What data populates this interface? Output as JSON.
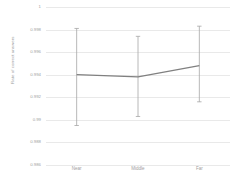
{
  "chart_data": {
    "type": "line",
    "title": "",
    "xlabel": "",
    "ylabel": "Rate of correct answers",
    "categories": [
      "Near",
      "Middle",
      "Far"
    ],
    "series": [
      {
        "name": "Rate of correct answers",
        "values": [
          0.994,
          0.9938,
          0.9948
        ],
        "error_low": [
          0.9895,
          0.9903,
          0.9916
        ],
        "error_high": [
          0.9981,
          0.9974,
          0.9983
        ]
      }
    ],
    "ylim": [
      0.986,
      1
    ],
    "yticks": [
      1,
      0.998,
      0.996,
      0.994,
      0.992,
      0.99,
      0.988,
      0.986
    ],
    "ytick_labels": [
      "1",
      "0.998",
      "0.996",
      "0.994",
      "0.992",
      "0.99",
      "0.988",
      "0.986"
    ],
    "grid": true,
    "legend": "none",
    "error_bars": true,
    "colors": {
      "line": "#808080",
      "error_bar": "#a6a6a6",
      "gridline": "#e9e9e9",
      "tick_text": "#a0a0a0",
      "axis_title_text": "#9a9a9a",
      "background": "#ffffff"
    }
  }
}
